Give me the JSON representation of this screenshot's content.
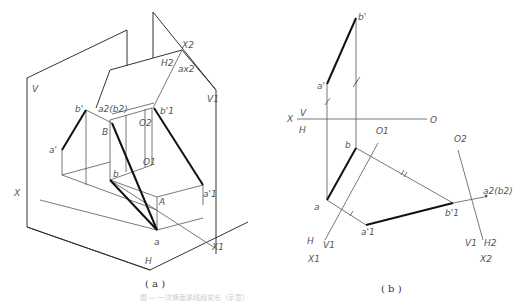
{
  "figure": {
    "caption_faint": "图 — 一次换面求线段实长（示意）",
    "panel_a": {
      "caption": "( a )",
      "labels": {
        "V": "V",
        "V1": "V1",
        "X": "X",
        "X1": "X1",
        "X2": "X2",
        "H": "H",
        "H2": "H2",
        "ax2": "ax2",
        "a_prime": "a'",
        "b_prime": "b'",
        "a2b2": "a2(b2)",
        "B": "B",
        "b1_prime": "b'1",
        "O2": "O2",
        "O1": "O1",
        "b": "b",
        "A": "A",
        "a1_prime": "a'1",
        "a": "a"
      }
    },
    "panel_b": {
      "caption": "( b )",
      "labels": {
        "b_prime": "b'",
        "a_prime": "a'",
        "X": "X",
        "V": "V",
        "H": "H",
        "O": "O",
        "O1": "O1",
        "O2": "O2",
        "b": "b",
        "a": "a",
        "a1_prime": "a'1",
        "b1_prime": "b'1",
        "a2b2": "a2(b2)",
        "H_l": "H",
        "V1_l": "V1",
        "X1": "X1",
        "V1_r": "V1",
        "H2": "H2",
        "X2": "X2"
      }
    }
  }
}
